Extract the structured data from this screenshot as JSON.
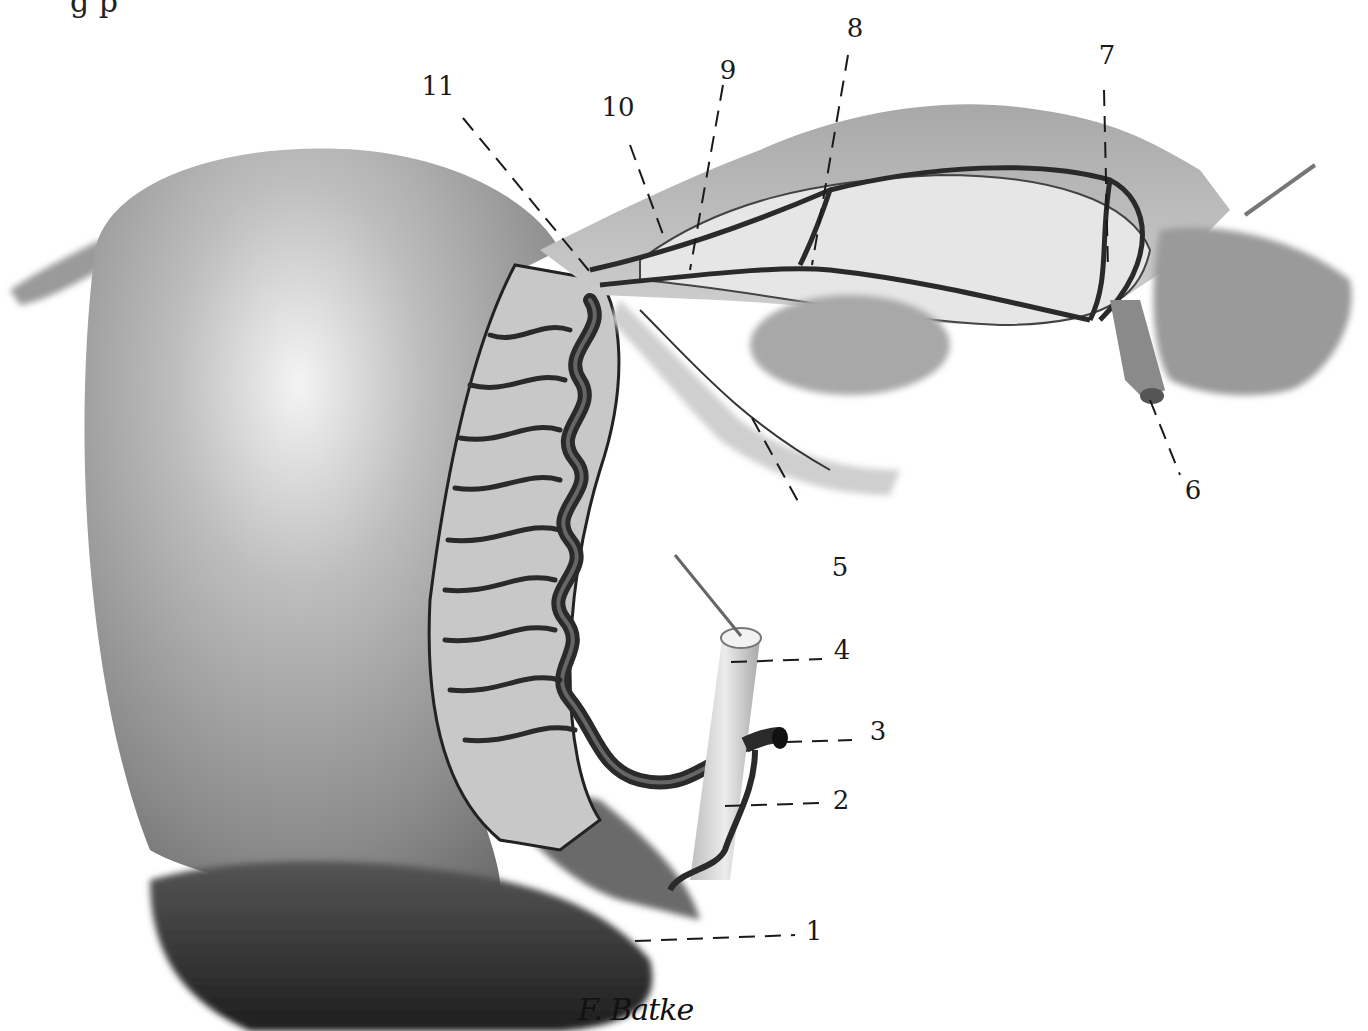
{
  "figure": {
    "clipped_header_text": "g p",
    "signature": "F. Batke",
    "colors": {
      "background": "#ffffff",
      "ink": "#1a1a1a",
      "uterus_mid": "#8a8a8a",
      "uterus_light": "#d8d8d8",
      "vessel_dark": "#2a2a2a",
      "ligament_light": "#bdbdbd"
    },
    "labels": [
      {
        "id": "1",
        "text": "1",
        "x": 814,
        "y": 931
      },
      {
        "id": "2",
        "text": "2",
        "x": 841,
        "y": 800
      },
      {
        "id": "3",
        "text": "3",
        "x": 878,
        "y": 731
      },
      {
        "id": "4",
        "text": "4",
        "x": 842,
        "y": 650
      },
      {
        "id": "5",
        "text": "5",
        "x": 840,
        "y": 567
      },
      {
        "id": "6",
        "text": "6",
        "x": 1193,
        "y": 490
      },
      {
        "id": "7",
        "text": "7",
        "x": 1107,
        "y": 55
      },
      {
        "id": "8",
        "text": "8",
        "x": 855,
        "y": 28
      },
      {
        "id": "9",
        "text": "9",
        "x": 728,
        "y": 70
      },
      {
        "id": "10",
        "text": "10",
        "x": 618,
        "y": 107
      },
      {
        "id": "11",
        "text": "11",
        "x": 438,
        "y": 86
      }
    ]
  }
}
